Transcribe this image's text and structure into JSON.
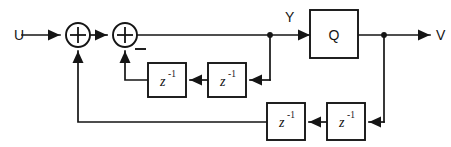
{
  "diagram": {
    "type": "control-block-diagram",
    "canvas": {
      "width": 451,
      "height": 147,
      "background": "#ffffff"
    },
    "line_color": "#151515",
    "signals": {
      "input_label": "U",
      "intermediate_label": "Y",
      "output_label": "V"
    },
    "summers": [
      {
        "name": "summing-junction-1",
        "symbol": "+",
        "cx": 78,
        "cy": 35,
        "r": 12,
        "sign_marks": []
      },
      {
        "name": "summing-junction-2",
        "symbol": "+",
        "cx": 125,
        "cy": 35,
        "r": 12,
        "sign_marks": [
          "−"
        ]
      }
    ],
    "blocks": [
      {
        "name": "quantizer-block",
        "label": "Q",
        "x": 310,
        "y": 10,
        "w": 48,
        "h": 48
      },
      {
        "name": "delay-block-upper-left",
        "label": "z",
        "exponent": "-1",
        "x": 148,
        "y": 63,
        "w": 38,
        "h": 34
      },
      {
        "name": "delay-block-upper-right",
        "label": "z",
        "exponent": "-1",
        "x": 208,
        "y": 63,
        "w": 38,
        "h": 34
      },
      {
        "name": "delay-block-lower-left",
        "label": "z",
        "exponent": "-1",
        "x": 267,
        "y": 103,
        "w": 38,
        "h": 37
      },
      {
        "name": "delay-block-lower-right",
        "label": "z",
        "exponent": "-1",
        "x": 327,
        "y": 103,
        "w": 38,
        "h": 37
      }
    ],
    "junction_dots": [
      {
        "name": "junction-dot-y",
        "cx": 270,
        "cy": 35,
        "r": 2.8
      },
      {
        "name": "junction-dot-v",
        "cx": 384,
        "cy": 35,
        "r": 2.8
      }
    ],
    "wire_paths": {
      "input_to_sum1": "M 22 35 L 60 35",
      "sum1_to_sum2": "M 90 35 L 107 35",
      "sum2_to_y": "M 137 35 L 310 35",
      "q_to_v": "M 358 35 L 430 35",
      "y_tap_down": "M 270 35 L 270 80",
      "y_tap_to_delay_ur": "M 270 80 L 250 80",
      "delay_ur_to_delay_ul": "M 208 80 L 190 80",
      "delay_ul_to_sum2": "M 148 80 L 125 80 L 125 51",
      "v_tap_down": "M 384 35 L 384 122",
      "v_tap_to_delay_lr": "M 384 122 L 369 122",
      "delay_lr_to_delay_ll": "M 327 122 L 309 122",
      "delay_ll_to_sum1": "M 267 122 L 78 122 L 78 51"
    },
    "arrowheads": [
      {
        "name": "arrowhead-input",
        "x": 60,
        "y": 35,
        "dir": "right"
      },
      {
        "name": "arrowhead-sum2-input",
        "x": 107,
        "y": 35,
        "dir": "right"
      },
      {
        "name": "arrowhead-q-input",
        "x": 310,
        "y": 35,
        "dir": "right"
      },
      {
        "name": "arrowhead-output",
        "x": 430,
        "y": 35,
        "dir": "right"
      },
      {
        "name": "arrowhead-delay-ur-input",
        "x": 250,
        "y": 80,
        "dir": "left"
      },
      {
        "name": "arrowhead-delay-ul-input",
        "x": 190,
        "y": 80,
        "dir": "left"
      },
      {
        "name": "arrowhead-sum2-feedback",
        "x": 125,
        "y": 51,
        "dir": "up"
      },
      {
        "name": "arrowhead-delay-lr-input",
        "x": 369,
        "y": 122,
        "dir": "left"
      },
      {
        "name": "arrowhead-delay-ll-input",
        "x": 309,
        "y": 122,
        "dir": "left"
      },
      {
        "name": "arrowhead-sum1-feedback",
        "x": 78,
        "y": 51,
        "dir": "up"
      }
    ],
    "labels": [
      {
        "name": "input-signal-label",
        "text": "U",
        "x": 14,
        "y": 40
      },
      {
        "name": "intermediate-signal-label",
        "text": "Y",
        "x": 288,
        "y": 21
      },
      {
        "name": "output-signal-label",
        "text": "V",
        "x": 437,
        "y": 40
      },
      {
        "name": "negative-sign-label",
        "text": "−",
        "x": 137,
        "y": 50
      }
    ]
  }
}
